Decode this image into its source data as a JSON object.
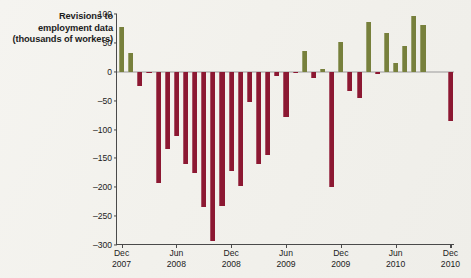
{
  "chart_data": {
    "type": "bar",
    "title": "Revisions to employment data (thousands of workers)",
    "title_lines": [
      "Revisions to",
      "employment data",
      "(thousands of workers)"
    ],
    "xlabel": "",
    "ylabel": "thousands of workers",
    "ylim": [
      -300,
      100
    ],
    "yticks": [
      100,
      50,
      0,
      -50,
      -100,
      -150,
      -200,
      -250,
      -300
    ],
    "ytick_labels": [
      "100",
      "50",
      "0",
      "–50",
      "–100",
      "–150",
      "–200",
      "–250",
      "–300"
    ],
    "grid": false,
    "legend": "none",
    "zero_line": true,
    "positive_color": "#77803c",
    "negative_color": "#8c1832",
    "xtick_labels": [
      {
        "month": "Dec",
        "year": "2007",
        "index": 0
      },
      {
        "month": "Jun",
        "year": "2008",
        "index": 6
      },
      {
        "month": "Dec",
        "year": "2008",
        "index": 12
      },
      {
        "month": "Jun",
        "year": "2009",
        "index": 18
      },
      {
        "month": "Dec",
        "year": "2009",
        "index": 24
      },
      {
        "month": "Jun",
        "year": "2010",
        "index": 30
      },
      {
        "month": "Dec",
        "year": "2010",
        "index": 36
      }
    ],
    "categories": [
      "Dec 2007",
      "Jan 2008",
      "Feb 2008",
      "Mar 2008",
      "Apr 2008",
      "May 2008",
      "Jun 2008",
      "Jul 2008",
      "Aug 2008",
      "Sep 2008",
      "Oct 2008",
      "Nov 2008",
      "Dec 2008",
      "Jan 2009",
      "Feb 2009",
      "Mar 2009",
      "Apr 2009",
      "May 2009",
      "Jun 2009",
      "Jul 2009",
      "Aug 2009",
      "Sep 2009",
      "Oct 2009",
      "Nov 2009",
      "Dec 2009",
      "Jan 2010",
      "Feb 2010",
      "Mar 2010",
      "Apr 2010",
      "May 2010",
      "Jun 2010",
      "Jul 2010",
      "Aug 2010",
      "Sep 2010",
      "Oct 2010",
      "Nov 2010",
      "Dec 2010"
    ],
    "values": [
      78,
      32,
      -24,
      -2,
      -192,
      -133,
      -111,
      -160,
      -175,
      -235,
      -293,
      -232,
      -172,
      -198,
      -52,
      -160,
      -144,
      -8,
      -78,
      -2,
      36,
      -10,
      4,
      -199,
      52,
      -33,
      -45,
      87,
      -4,
      67,
      15,
      45,
      97,
      81,
      0,
      0,
      -85
    ]
  }
}
